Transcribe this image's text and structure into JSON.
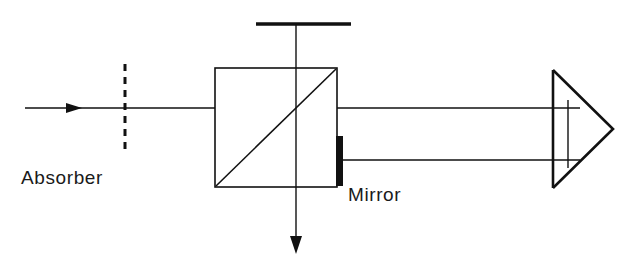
{
  "figure": {
    "kind": "optical-interferometer-schematic",
    "background_color": "#ffffff",
    "line_color": "#111111",
    "width": 636,
    "height": 264
  },
  "labels": {
    "absorber": "Absorber",
    "mirror": "Mirror"
  },
  "components": {
    "input_beam": {
      "name": "input-beam",
      "x1": 25,
      "y1": 108,
      "x2": 215,
      "y2": 108,
      "arrow_x": 78,
      "arrow_y": 108
    },
    "absorber_plate": {
      "name": "absorber-dashed-plate",
      "x": 125,
      "y_top": 64,
      "y_bottom": 153,
      "style": "dashed"
    },
    "beam_splitter_cube": {
      "name": "beam-splitter-cube",
      "left": 215,
      "top": 68,
      "right": 337,
      "bottom": 187,
      "diagonal": "bottom-left-to-top-right"
    },
    "top_plate": {
      "name": "top-reference-plate",
      "x1": 256,
      "x2": 351,
      "y": 24
    },
    "vertical_beam": {
      "name": "vertical-output-beam",
      "x": 296,
      "y_top": 24,
      "y_bottom": 252,
      "arrow_y": 252
    },
    "mirror_bar": {
      "name": "mirror-bar",
      "x": 336,
      "y_top": 136,
      "width": 7,
      "height": 50
    },
    "upper_beam": {
      "name": "upper-horizontal-beam",
      "x1": 337,
      "x2": 578,
      "y": 108
    },
    "lower_beam": {
      "name": "lower-horizontal-beam",
      "x1": 343,
      "x2": 578,
      "y": 160
    },
    "prism": {
      "name": "retroreflector-prism",
      "apex_x": 613,
      "apex_y": 129,
      "top_x": 553,
      "top_y": 70,
      "bottom_x": 553,
      "bottom_y": 188,
      "face_x": 568,
      "face_y_top": 103,
      "face_y_bottom": 165
    }
  }
}
